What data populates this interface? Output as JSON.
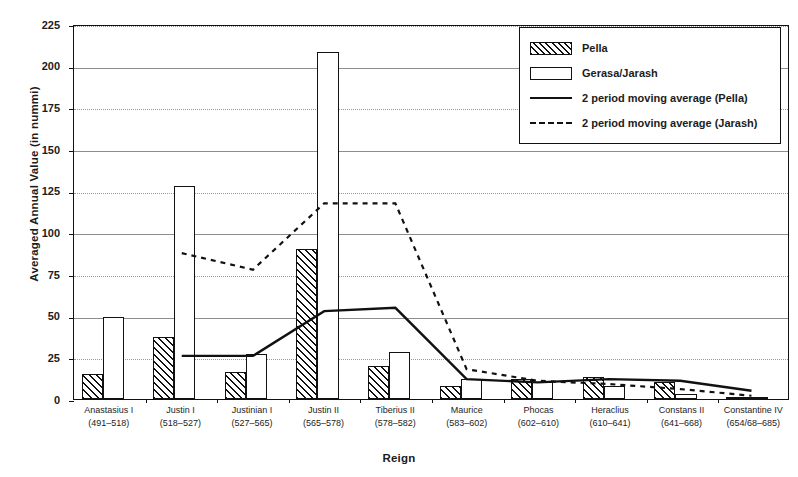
{
  "chart_data": {
    "type": "bar",
    "title": "",
    "xlabel": "Reign",
    "ylabel": "Averaged Annual Value (in nummi)",
    "ylim": [
      0,
      225
    ],
    "yticks": [
      0,
      25,
      50,
      75,
      100,
      125,
      150,
      175,
      200,
      225
    ],
    "grid": true,
    "legend_position": "top-right",
    "categories": [
      "Anastasius I",
      "Justin I",
      "Justinian I",
      "Justin II",
      "Tiberius II",
      "Maurice",
      "Phocas",
      "Heraclius",
      "Constans II",
      "Constantine IV"
    ],
    "category_dates": [
      "(491–518)",
      "(518–527)",
      "(527–565)",
      "(565–578)",
      "(578–582)",
      "(583–602)",
      "(602–610)",
      "(610–641)",
      "(641–668)",
      "(654/68–685)"
    ],
    "series": [
      {
        "name": "Pella",
        "kind": "bar",
        "values": [
          15,
          37,
          16,
          90,
          20,
          8,
          12,
          13,
          10,
          1
        ]
      },
      {
        "name": "Gerasa/Jarash",
        "kind": "bar",
        "values": [
          49,
          128,
          27,
          208,
          28,
          12,
          10,
          8,
          3,
          1
        ]
      },
      {
        "name": "2 period moving average (Pella)",
        "kind": "line",
        "style": "solid",
        "values": [
          null,
          26,
          26,
          53,
          55,
          12,
          10,
          12,
          11,
          5
        ]
      },
      {
        "name": "2 period moving average (Jarash)",
        "kind": "line",
        "style": "dashed",
        "values": [
          null,
          88,
          78,
          118,
          118,
          18,
          11,
          9,
          6,
          2
        ]
      }
    ]
  },
  "legend": {
    "items": [
      {
        "label": "Pella",
        "key": "hatched-swatch"
      },
      {
        "label": "Gerasa/Jarash",
        "key": "open-swatch"
      },
      {
        "label": "2 period moving average (Pella)",
        "key": "solid-line"
      },
      {
        "label": "2 period moving average (Jarash)",
        "key": "dashed-line"
      }
    ]
  },
  "axes": {
    "y_title": "Averaged Annual Value (in nummi)",
    "x_title": "Reign",
    "y_tick_labels": [
      "225",
      "200",
      "175",
      "150",
      "125",
      "100",
      "75",
      "50",
      "25",
      "0"
    ]
  },
  "colors": {
    "ink": "#111111",
    "grid": "#8d8d8d",
    "background": "#ffffff"
  }
}
